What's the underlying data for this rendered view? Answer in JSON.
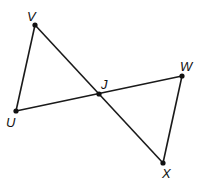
{
  "diagram": {
    "points": [
      {
        "id": "V",
        "label": "V",
        "x": 35,
        "y": 25,
        "lx": 27,
        "ly": 21
      },
      {
        "id": "U",
        "label": "U",
        "x": 16,
        "y": 111,
        "lx": 6,
        "ly": 127
      },
      {
        "id": "J",
        "label": "J",
        "x": 99,
        "y": 94,
        "lx": 101,
        "ly": 89
      },
      {
        "id": "W",
        "label": "W",
        "x": 182,
        "y": 76,
        "lx": 180,
        "ly": 71
      },
      {
        "id": "X",
        "label": "X",
        "x": 163,
        "y": 163,
        "lx": 162,
        "ly": 178
      }
    ],
    "segments": [
      [
        "V",
        "X"
      ],
      [
        "U",
        "W"
      ],
      [
        "V",
        "U"
      ],
      [
        "W",
        "X"
      ]
    ],
    "colors": {
      "stroke": "#1a1a1a",
      "background": "#ffffff"
    }
  }
}
